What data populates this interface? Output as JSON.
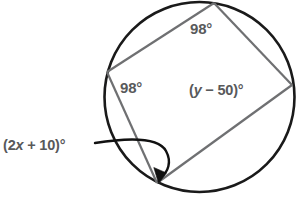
{
  "figure": {
    "background_color": "#ffffff",
    "circle": {
      "stroke_color": "#1a1a1a",
      "stroke_width": 2.6,
      "center_x": 199.5,
      "center_y": 97,
      "radius": 95
    },
    "polygon": {
      "stroke_color": "#6f7072",
      "stroke_width": 2.2,
      "vertices": [
        {
          "name": "top-vertex",
          "x": 214,
          "y": 3
        },
        {
          "name": "right-vertex",
          "x": 292,
          "y": 85
        },
        {
          "name": "bottom-vertex",
          "x": 157,
          "y": 183
        },
        {
          "name": "left-vertex",
          "x": 107,
          "y": 72
        }
      ]
    },
    "arrow": {
      "stroke_color": "#111111",
      "stroke_width": 2.4,
      "start_x": 95,
      "start_y": 143,
      "tip_x": 159,
      "tip_y": 180
    },
    "labels": [
      {
        "name": "angle-label-top",
        "text": "98°",
        "value": "98",
        "unit": "°",
        "x": 190,
        "y": 34,
        "color": "#58595b"
      },
      {
        "name": "angle-label-left",
        "text": "98°",
        "value": "98",
        "unit": "°",
        "x": 120,
        "y": 93,
        "color": "#58595b"
      },
      {
        "name": "angle-label-right",
        "text": "(y − 50)°",
        "prefix": "(",
        "variable": "y",
        "operator": " − ",
        "number": "50",
        "suffix": ")",
        "unit": "°",
        "x": 189,
        "y": 95,
        "color": "#58595b"
      },
      {
        "name": "angle-label-bottom",
        "text": "(2x + 10)°",
        "prefix": "(2",
        "variable": "x",
        "operator": " + ",
        "number": "10",
        "suffix": ")",
        "unit": "°",
        "x": 3,
        "y": 150,
        "color": "#58595b"
      }
    ]
  }
}
